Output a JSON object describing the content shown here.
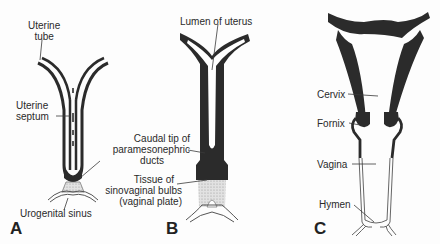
{
  "figure": {
    "panels": [
      {
        "letter": "A",
        "labels": {
          "uterine_tube_1": "Uterine",
          "uterine_tube_2": "tube",
          "uterine_septum_1": "Uterine",
          "uterine_septum_2": "septum",
          "urogenital_sinus": "Urogenital sinus"
        }
      },
      {
        "letter": "B",
        "labels": {
          "lumen": "Lumen of uterus",
          "caudal_1": "Caudal tip of",
          "caudal_2": "paramesonephric",
          "caudal_3": "ducts",
          "tissue_1": "Tissue of",
          "tissue_2": "sinovaginal bulbs",
          "tissue_3": "(vaginal plate)"
        }
      },
      {
        "letter": "C",
        "labels": {
          "cervix": "Cervix",
          "fornix": "Fornix",
          "vagina": "Vagina",
          "hymen": "Hymen"
        }
      }
    ],
    "colors": {
      "tissue_dark": "#2b2b2b",
      "tissue_light": "#d8d8d8",
      "line": "#3a3a3a"
    }
  }
}
